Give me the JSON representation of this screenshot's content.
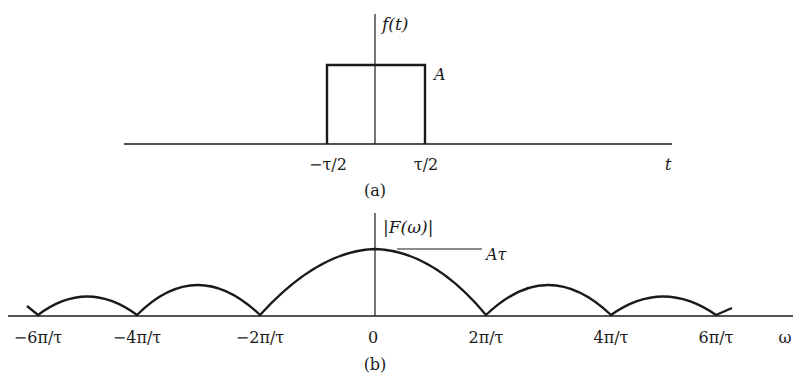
{
  "panel_a": {
    "y_axis_label": "f(t)",
    "amplitude_label": "A",
    "x_axis_label": "t",
    "tick_labels": [
      "−τ/2",
      "τ/2"
    ],
    "caption": "(a)"
  },
  "panel_b": {
    "y_axis_label": "|F(ω)|",
    "peak_label": "Aτ",
    "x_axis_label": "ω",
    "tick_labels": [
      "−6π/τ",
      "−4π/τ",
      "−2π/τ",
      "0",
      "2π/τ",
      "4π/τ",
      "6π/τ"
    ],
    "caption": "(b)"
  },
  "colors": {
    "ink": "#1a1a1a",
    "background": "#ffffff"
  }
}
